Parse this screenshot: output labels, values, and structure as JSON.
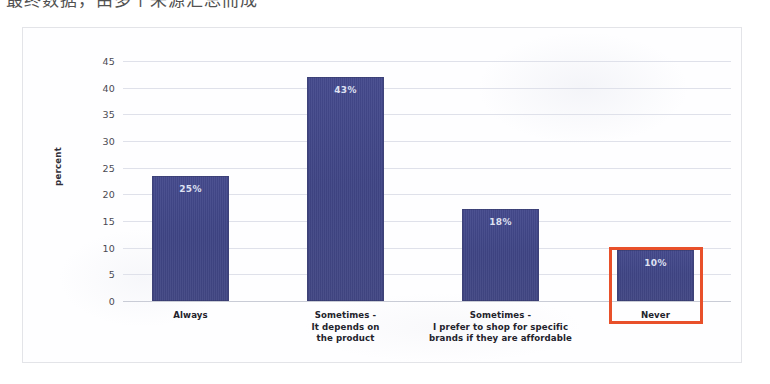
{
  "overlay": {
    "top_cut_text": "最终数据，由多个来源汇总而成"
  },
  "colors": {
    "bar": "#3f4585",
    "bar_label": "#dfe1f2",
    "grid": "#dfe1ea",
    "highlight": "#e8502a",
    "card_background": "#fefeff",
    "card_border": "#e3e4e8",
    "tick_text": "#4a4a52"
  },
  "chart_data": {
    "type": "bar",
    "title": "",
    "xlabel": "",
    "ylabel": "percent",
    "ylim": [
      0,
      45
    ],
    "yticks": [
      0,
      5,
      10,
      15,
      20,
      25,
      30,
      35,
      40,
      45
    ],
    "ytick_labels": [
      "0",
      "5",
      "10",
      "15",
      "20",
      "25",
      "30",
      "35",
      "40",
      "45"
    ],
    "grid": true,
    "legend": "none",
    "categories": [
      "Always",
      "Sometimes -\nIt depends on\nthe product",
      "Sometimes -\nI prefer to shop for specific\nbrands if they are affordable",
      "Never"
    ],
    "category_lines": [
      [
        "Always"
      ],
      [
        "Sometimes -",
        "It depends on",
        "the product"
      ],
      [
        "Sometimes -",
        "I prefer to shop for specific",
        "brands if they are affordable"
      ],
      [
        "Never"
      ]
    ],
    "values": [
      23.5,
      42.0,
      17.3,
      9.5
    ],
    "data_labels": [
      "25%",
      "43%",
      "18%",
      "10%"
    ],
    "annotations": [
      {
        "type": "rectangle",
        "target_category": "Never",
        "color": "#e8502a",
        "encloses": [
          "bar",
          "category-label"
        ]
      }
    ]
  }
}
